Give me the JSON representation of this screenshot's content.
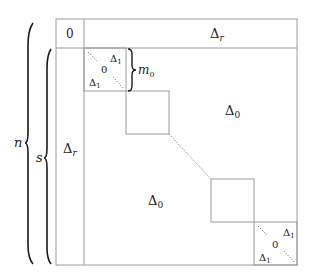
{
  "diagram": {
    "type": "block-matrix",
    "colors": {
      "line": "#9a9a9a",
      "brace": "#1a1a1a",
      "text": "#222222",
      "background": "#ffffff"
    },
    "top_row": {
      "corner_cell": "0",
      "right_cell": "Δ",
      "right_cell_sub": "r"
    },
    "left_column": {
      "label": "Δ",
      "label_sub": "r"
    },
    "upper_off_diagonal": {
      "label": "Δ",
      "label_sub": "0"
    },
    "lower_off_diagonal": {
      "label": "Δ",
      "label_sub": "0"
    },
    "first_block": {
      "top_right": "Δ",
      "top_right_sub": "1",
      "center": "0",
      "bottom_left": "Δ",
      "bottom_left_sub": "1",
      "brace_label": "m",
      "brace_label_sub": "0"
    },
    "last_block": {
      "top_right": "Δ",
      "top_right_sub": "1",
      "center": "0",
      "bottom_left": "Δ",
      "bottom_left_sub": "1"
    },
    "braces": [
      {
        "label": "n",
        "span": "full height"
      },
      {
        "label": "s",
        "span": "below top row"
      }
    ]
  }
}
